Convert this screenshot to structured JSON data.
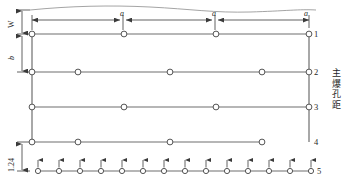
{
  "diagram": {
    "title_vertical_cn": "主爆孔距",
    "title_vertical_chars": [
      "主",
      "爆",
      "孔",
      "距"
    ],
    "colors": {
      "line": "#6e6e6e",
      "hole_stroke": "#555555",
      "hole_fill": "#ffffff",
      "dim_line": "#3a3a3a",
      "terrain_line": "#9a9a9a",
      "text": "#1f1f1f"
    },
    "dimensions": {
      "top_segments": [
        {
          "label": "a",
          "x1": 32,
          "x2": 122
        },
        {
          "label": "a",
          "x1": 124,
          "x2": 214
        },
        {
          "label": "a",
          "x1": 216,
          "x2": 309
        }
      ],
      "left_labels": [
        {
          "name": "W",
          "label": "W",
          "y1": 10,
          "y2": 33
        },
        {
          "name": "b",
          "label": "b",
          "y1": 34,
          "y2": 72
        },
        {
          "name": "bottom-spacing",
          "label": "1.24",
          "y1": 142,
          "y2": 171
        }
      ]
    },
    "row_numbers": [
      "1",
      "2",
      "3",
      "4",
      "5"
    ],
    "rows": [
      {
        "id": "row-1",
        "number": "1",
        "y": 34,
        "holes_x": [
          32,
          124,
          216,
          309
        ]
      },
      {
        "id": "row-2",
        "number": "2",
        "y": 72,
        "holes_x": [
          32,
          78,
          170,
          262,
          309
        ]
      },
      {
        "id": "row-3",
        "number": "3",
        "y": 107,
        "holes_x": [
          32,
          124,
          216,
          309
        ]
      },
      {
        "id": "row-4",
        "number": "4",
        "y": 142,
        "holes_x": [
          32,
          78,
          170,
          262
        ]
      },
      {
        "id": "row-5",
        "number": "5",
        "y": 171,
        "holes_x": [
          38,
          59,
          80,
          101,
          122,
          143,
          164,
          185,
          206,
          227,
          248,
          269,
          290,
          311
        ],
        "has_arrows": true
      }
    ],
    "connectors": [
      {
        "name": "left-edge-connector",
        "x": 32,
        "y1": 34,
        "y2": 142
      },
      {
        "name": "right-edge-connector",
        "x": 309,
        "y1": 34,
        "y2": 142
      }
    ],
    "terrain_line": "wavy-free-face"
  }
}
